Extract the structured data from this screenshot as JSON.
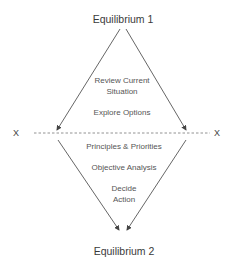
{
  "diagram": {
    "top_node": "Equilibrium 1",
    "bottom_node": "Equilibrium 2",
    "upper_steps": [
      {
        "line1": "Review Current",
        "line2": "Situation"
      },
      {
        "line1": "Explore Options",
        "line2": ""
      }
    ],
    "lower_steps": [
      {
        "line1": "Principles & Priorities",
        "line2": ""
      },
      {
        "line1": "Objective Analysis",
        "line2": ""
      },
      {
        "line1": "Decide",
        "line2": "Action"
      }
    ],
    "axis_left_marker": "X",
    "axis_right_marker": "X",
    "colors": {
      "line": "#555555",
      "text": "#444444",
      "dashed": "#777777"
    }
  }
}
